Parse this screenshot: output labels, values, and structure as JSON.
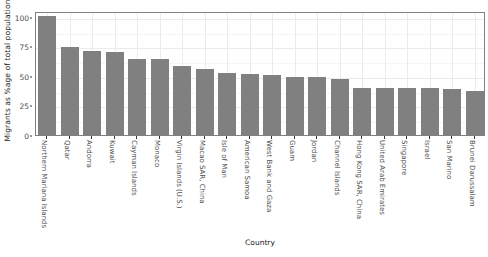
{
  "chart_data": {
    "type": "bar",
    "title": "",
    "subtitle": "",
    "xlabel": "Country",
    "ylabel": "Migrants as %age of total population",
    "ylim": [
      0,
      105
    ],
    "y_ticks": [
      0,
      25,
      50,
      75,
      100
    ],
    "y_tick_labels": [
      "0",
      "25",
      "50",
      "75",
      "100"
    ],
    "grid": true,
    "legend": "none",
    "bar_color": "#808080",
    "panel_background": "#ffffff",
    "panel_border_color": "#808080",
    "gridline_major_color": "#ebebeb",
    "gridline_minor_color": "#f5f5f5",
    "categories": [
      "Northern Mariana Islands",
      "Qatar",
      "Andorra",
      "Kuwait",
      "Cayman Islands",
      "Monaco",
      "Virgin Islands (U.S.)",
      "Macao SAR, China",
      "Isle of Man",
      "American Samoa",
      "West Bank and Gaza",
      "Guam",
      "Jordan",
      "Channel Islands",
      "Hong Kong SAR, China",
      "United Arab Emirates",
      "Singapore",
      "Israel",
      "San Marino",
      "Brunei Darussalam"
    ],
    "values": [
      101,
      74.5,
      71.5,
      70.5,
      64.5,
      64,
      58.5,
      56,
      52.5,
      51.5,
      50.5,
      49.5,
      49,
      47.5,
      40,
      40,
      39.5,
      39.5,
      39,
      37.5
    ]
  },
  "axes": {
    "y_title": "Migrants as %age of total population",
    "x_title": "Country"
  }
}
